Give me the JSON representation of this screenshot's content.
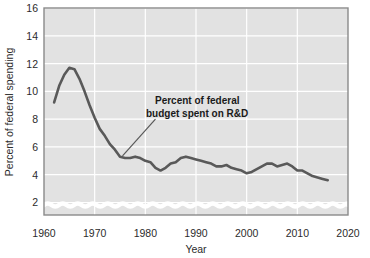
{
  "chart_data": {
    "type": "line",
    "title": "",
    "subtitle": "",
    "xlabel": "Year",
    "ylabel": "Percent of federal spending",
    "xlim": [
      1960,
      2020
    ],
    "ylim": [
      1.1,
      16
    ],
    "y_axis_break": true,
    "y_axis_break_note": "wavy break between 0 and 2 on the value axis",
    "grid": true,
    "grid_color": "#ffffff",
    "plot_background": "#e2e2e2",
    "series_color": "#595959",
    "legend": "none",
    "xticks": [
      1960,
      1970,
      1980,
      1990,
      2000,
      2010,
      2020
    ],
    "xticklabels": [
      "1960",
      "1970",
      "1980",
      "1990",
      "2000",
      "2010",
      "2020"
    ],
    "yticks": [
      2,
      4,
      6,
      8,
      10,
      12,
      14,
      16
    ],
    "yticklabels": [
      "2",
      "4",
      "6",
      "8",
      "10",
      "12",
      "14",
      "16"
    ],
    "series": [
      {
        "name": "Percent of federal budget spent on R&D",
        "x": [
          1962,
          1963,
          1964,
          1965,
          1966,
          1967,
          1968,
          1969,
          1970,
          1971,
          1972,
          1973,
          1974,
          1975,
          1976,
          1977,
          1978,
          1979,
          1980,
          1981,
          1982,
          1983,
          1984,
          1985,
          1986,
          1987,
          1988,
          1989,
          1990,
          1991,
          1992,
          1993,
          1994,
          1995,
          1996,
          1997,
          1998,
          1999,
          2000,
          2001,
          2002,
          2003,
          2004,
          2005,
          2006,
          2007,
          2008,
          2009,
          2010,
          2011,
          2012,
          2013,
          2014,
          2015,
          2016
        ],
        "values": [
          9.2,
          10.4,
          11.2,
          11.7,
          11.6,
          10.9,
          10.0,
          9.0,
          8.1,
          7.3,
          6.8,
          6.2,
          5.8,
          5.3,
          5.2,
          5.2,
          5.3,
          5.2,
          5.0,
          4.9,
          4.5,
          4.3,
          4.5,
          4.8,
          4.9,
          5.2,
          5.3,
          5.2,
          5.1,
          5.0,
          4.9,
          4.8,
          4.6,
          4.6,
          4.7,
          4.5,
          4.4,
          4.3,
          4.1,
          4.2,
          4.4,
          4.6,
          4.8,
          4.8,
          4.6,
          4.7,
          4.8,
          4.6,
          4.3,
          4.3,
          4.1,
          3.9,
          3.8,
          3.7,
          3.6
        ]
      }
    ],
    "annotations": [
      {
        "id": "series-callout",
        "line1": "Percent of federal",
        "line2": "budget spent on R&D",
        "leader_from": [
          1975.5,
          5.35
        ],
        "leader_to": [
          1982,
          8.0
        ]
      }
    ]
  }
}
